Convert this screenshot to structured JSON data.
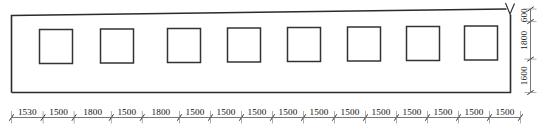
{
  "drawing": {
    "type": "architectural-elevation",
    "title": "Wall elevation with window openings",
    "units": "mm",
    "wall": {
      "outline_stroke": "#2b2b2b",
      "fill": "#ffffff",
      "break_symbol": "V"
    },
    "openings": {
      "count": 8,
      "shape": "rectangle",
      "label": "window-opening"
    },
    "bottom_dimensions": {
      "label": "horizontal-dimension-chain",
      "segments": [
        {
          "value": "1530",
          "span": 1530
        },
        {
          "value": "1500",
          "span": 1500
        },
        {
          "value": "1800",
          "span": 1800
        },
        {
          "value": "1500",
          "span": 1500
        },
        {
          "value": "1800",
          "span": 1800
        },
        {
          "value": "1500",
          "span": 1500
        },
        {
          "value": "1500",
          "span": 1500
        },
        {
          "value": "1500",
          "span": 1500
        },
        {
          "value": "1500",
          "span": 1500
        },
        {
          "value": "1500",
          "span": 1500
        },
        {
          "value": "1500",
          "span": 1500
        },
        {
          "value": "1500",
          "span": 1500
        },
        {
          "value": "1500",
          "span": 1500
        },
        {
          "value": "1500",
          "span": 1500
        },
        {
          "value": "1500",
          "span": 1500
        },
        {
          "value": "1500",
          "span": 1500
        }
      ]
    },
    "right_dimensions": {
      "label": "vertical-dimension-chain",
      "segments": [
        {
          "value": "600",
          "span": 600
        },
        {
          "value": "1800",
          "span": 1800
        },
        {
          "value": "1600",
          "span": 1600
        }
      ]
    },
    "colors": {
      "line": "#2b2b2b",
      "dimension": "#5e5e5e",
      "background": "#ffffff"
    }
  }
}
